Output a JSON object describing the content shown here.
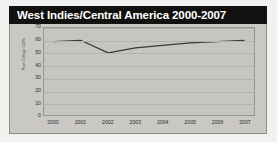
{
  "chart_data": {
    "type": "line",
    "title": "West Indies/Central America 2000-2007",
    "xlabel": "",
    "ylabel": "Post College 100%",
    "categories": [
      "2000",
      "2001",
      "2002",
      "2003",
      "2004",
      "2005",
      "2006",
      "2007"
    ],
    "x": [
      2000,
      2001,
      2002,
      2003,
      2004,
      2005,
      2006,
      2007
    ],
    "series": [
      {
        "name": "West Indies/Central America",
        "values": [
          59,
          60,
          50,
          54,
          56,
          58,
          59,
          60
        ]
      }
    ],
    "ylim": [
      0,
      70
    ],
    "yticks": [
      70,
      60,
      50,
      40,
      30,
      20,
      10,
      0
    ],
    "ytick_labels": [
      "70",
      "60",
      "50",
      "40",
      "30",
      "20",
      "10",
      "0"
    ],
    "grid": true,
    "legend": false,
    "legend_position": "none",
    "line_color": "#3a3936",
    "plot_background": "#c6c5c1",
    "title_background": "#111110",
    "title_color": "#ffffff"
  }
}
